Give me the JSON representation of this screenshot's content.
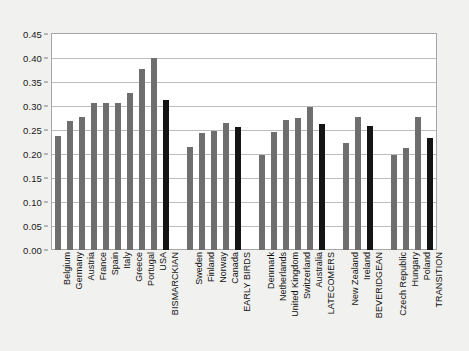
{
  "chart_data": {
    "type": "bar",
    "title": "",
    "subtitle": "",
    "xlabel": "",
    "ylabel": "",
    "ylim": [
      0,
      0.45
    ],
    "grid": true,
    "legend": false,
    "ytick_labels": [
      "0.45",
      "0.40",
      "0.35",
      "0.30",
      "0.25",
      "0.20",
      "0.15",
      "0.10",
      "0.05",
      "0.00"
    ],
    "ytick_values": [
      0.45,
      0.4,
      0.35,
      0.3,
      0.25,
      0.2,
      0.15,
      0.1,
      0.05,
      0.0
    ],
    "colors": {
      "country_bar": "#6e6e6e",
      "aggregate_bar": "#141414",
      "plot_background": "#ffffff",
      "figure_background": "#f1f1ef",
      "gridline": "#bdbdbd",
      "axis_border": "#a6a6a6"
    },
    "groups": [
      {
        "name": "BISMARCKIAN",
        "categories": [
          "Belgium",
          "Germany",
          "Austria",
          "France",
          "Spain",
          "Italy",
          "Greece",
          "Portugal",
          "USA"
        ],
        "values": [
          0.238,
          0.268,
          0.277,
          0.307,
          0.307,
          0.307,
          0.327,
          0.378,
          0.4
        ],
        "aggregate_label": "BISMARCKIAN",
        "aggregate_value": 0.312
      },
      {
        "name": "EARLY BIRDS",
        "categories": [
          "Sweden",
          "Finland",
          "Norway",
          "Canada"
        ],
        "values": [
          0.214,
          0.243,
          0.248,
          0.265
        ],
        "aggregate_label": "EARLY BIRDS",
        "aggregate_value": 0.257
      },
      {
        "name": "LATECOMERS",
        "categories": [
          "Denmark",
          "Netherlands",
          "United Kingdom",
          "Switzerland",
          "Australia"
        ],
        "values": [
          0.197,
          0.245,
          0.271,
          0.275,
          0.298
        ],
        "aggregate_label": "LATECOMERS",
        "aggregate_value": 0.262
      },
      {
        "name": "BEVERIDGEAN",
        "categories": [
          "New Zealand",
          "Ireland"
        ],
        "values": [
          0.223,
          0.277
        ],
        "aggregate_label": "BEVERIDGEAN",
        "aggregate_value": 0.258
      },
      {
        "name": "TRANSITION",
        "categories": [
          "Czech Republic",
          "Hungary",
          "Poland"
        ],
        "values": [
          0.197,
          0.213,
          0.277
        ],
        "aggregate_label": "TRANSITION",
        "aggregate_value": 0.233
      }
    ],
    "all_categories": [
      "Belgium",
      "Germany",
      "Austria",
      "France",
      "Spain",
      "Italy",
      "Greece",
      "Portugal",
      "USA",
      "BISMARCKIAN",
      "Sweden",
      "Finland",
      "Norway",
      "Canada",
      "EARLY BIRDS",
      "Denmark",
      "Netherlands",
      "United Kingdom",
      "Switzerland",
      "Australia",
      "LATECOMERS",
      "New Zealand",
      "Ireland",
      "BEVERIDGEAN",
      "Czech Republic",
      "Hungary",
      "Poland",
      "TRANSITION"
    ],
    "all_values": [
      0.238,
      0.268,
      0.277,
      0.307,
      0.307,
      0.307,
      0.327,
      0.378,
      0.4,
      0.312,
      0.214,
      0.243,
      0.248,
      0.265,
      0.257,
      0.197,
      0.245,
      0.271,
      0.275,
      0.298,
      0.262,
      0.223,
      0.277,
      0.258,
      0.197,
      0.213,
      0.277,
      0.233
    ]
  }
}
